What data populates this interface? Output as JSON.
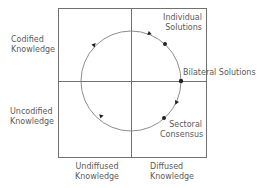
{
  "diagram": {
    "type": "quadrant-cycle",
    "row_labels": [
      {
        "line1": "Codified",
        "line2": "Knowledge"
      },
      {
        "line1": "Uncodified",
        "line2": "Knowledge"
      }
    ],
    "column_labels": [
      {
        "line1": "Undiffused",
        "line2": "Knowledge"
      },
      {
        "line1": "Diffused",
        "line2": "Knowledge"
      }
    ],
    "points": [
      {
        "line1": "Individual",
        "line2": "Solutions"
      },
      {
        "line1": "Bilateral Solutions"
      },
      {
        "line1": "Sectoral",
        "line2": "Consensus"
      }
    ],
    "cycle_direction": "clockwise",
    "colors": {
      "line": "#707070",
      "text": "#5a5a5a",
      "marker": "#222222"
    }
  }
}
